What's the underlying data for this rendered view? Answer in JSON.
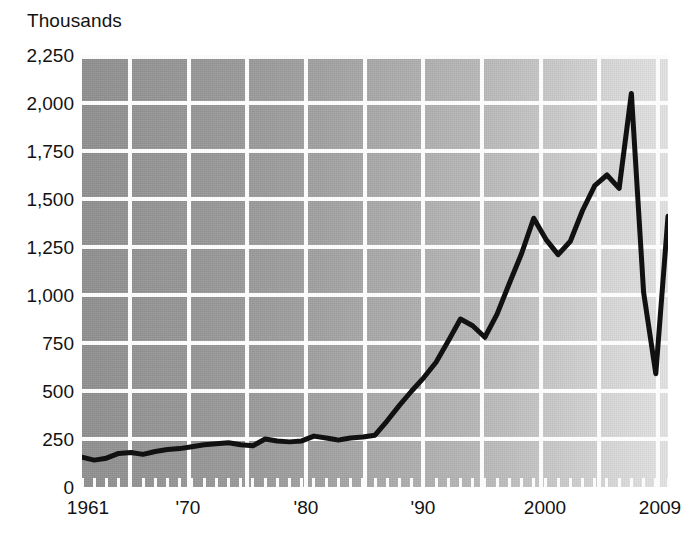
{
  "chart_data": {
    "type": "line",
    "title": "",
    "subtitle": "",
    "units_label": "Thousands",
    "xlabel": "",
    "ylabel": "Thousands",
    "grid": true,
    "legend": "none",
    "xlim": [
      1961,
      2009
    ],
    "ylim": [
      0,
      2250
    ],
    "y_ticks": [
      0,
      250,
      500,
      750,
      1000,
      1250,
      1500,
      1750,
      2000,
      2250
    ],
    "y_tick_labels": [
      "0",
      "250",
      "500",
      "750",
      "1,000",
      "1,250",
      "1,500",
      "1,750",
      "2,000",
      "2,250"
    ],
    "x_ticks": [
      1961,
      1970,
      1980,
      1990,
      2000,
      2009
    ],
    "x_tick_labels": [
      "1961",
      "'70",
      "'80",
      "'90",
      "2000",
      "2009"
    ],
    "x_minor_tick_interval": 1,
    "series": [
      {
        "name": "series-1",
        "color": "#111111",
        "x": [
          1961,
          1962,
          1963,
          1964,
          1965,
          1966,
          1967,
          1968,
          1969,
          1970,
          1971,
          1972,
          1973,
          1974,
          1975,
          1976,
          1977,
          1978,
          1979,
          1980,
          1981,
          1982,
          1983,
          1984,
          1985,
          1986,
          1987,
          1988,
          1989,
          1990,
          1991,
          1992,
          1993,
          1994,
          1995,
          1996,
          1997,
          1998,
          1999,
          2000,
          2001,
          2002,
          2003,
          2004,
          2005,
          2006,
          2007,
          2008,
          2009
        ],
        "values": [
          155,
          140,
          150,
          175,
          180,
          170,
          185,
          195,
          200,
          210,
          220,
          225,
          230,
          220,
          215,
          250,
          240,
          235,
          240,
          265,
          255,
          245,
          255,
          260,
          270,
          345,
          425,
          500,
          570,
          650,
          760,
          875,
          840,
          780,
          900,
          1060,
          1215,
          1400,
          1290,
          1210,
          1280,
          1440,
          1570,
          1625,
          1555,
          2050,
          1015,
          590,
          1410
        ]
      }
    ],
    "annotations": []
  },
  "axis": {
    "units_label": "Thousands"
  },
  "y_labels": {
    "t0": "0",
    "t1": "250",
    "t2": "500",
    "t3": "750",
    "t4": "1,000",
    "t5": "1,250",
    "t6": "1,500",
    "t7": "1,750",
    "t8": "2,000",
    "t9": "2,250"
  },
  "x_labels": {
    "t0": "1961",
    "t1": "'70",
    "t2": "'80",
    "t3": "'90",
    "t4": "2000",
    "t5": "2009"
  },
  "colors": {
    "line": "#111111",
    "grid": "#fbfbfb",
    "plot_left": "#8f8f8f",
    "plot_right": "#e2e2e2",
    "text": "#131313",
    "page_background": "#ffffff"
  }
}
